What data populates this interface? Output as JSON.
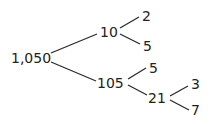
{
  "diagram": {
    "type": "factor-tree",
    "nodes": {
      "root": "1,050",
      "n10": "10",
      "n2": "2",
      "n5a": "5",
      "n105": "105",
      "n5b": "5",
      "n21": "21",
      "n3": "3",
      "n7": "7"
    },
    "edges": [
      [
        "1,050",
        "10"
      ],
      [
        "1,050",
        "105"
      ],
      [
        "10",
        "2"
      ],
      [
        "10",
        "5"
      ],
      [
        "105",
        "5"
      ],
      [
        "105",
        "21"
      ],
      [
        "21",
        "3"
      ],
      [
        "21",
        "7"
      ]
    ],
    "colors": {
      "text": "#222222",
      "line": "#2a2a2a",
      "background": "#ffffff"
    }
  }
}
